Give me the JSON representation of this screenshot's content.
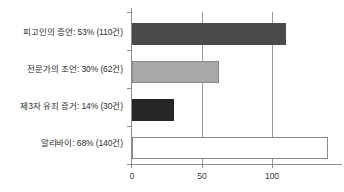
{
  "chart_data": {
    "type": "bar",
    "orientation": "horizontal",
    "title": "",
    "xlabel": "",
    "ylabel": "",
    "xlim": [
      0,
      150
    ],
    "xticks": [
      0,
      50,
      100
    ],
    "xtick_labels": [
      "0",
      "50",
      "100"
    ],
    "grid": true,
    "legend": false,
    "categories": [
      "피고인의 증언: 53% (110건)",
      "전문가의 조언: 30% (62건)",
      "제3자 유죄 증거: 14% (30건)",
      "알리바이: 68% (140건)"
    ],
    "values": [
      110,
      62,
      30,
      140
    ],
    "percents": [
      53,
      30,
      14,
      68
    ],
    "counts": [
      110,
      62,
      30,
      140
    ],
    "bar_colors": [
      "#4a4a4a",
      "#a9a9a9",
      "#262626",
      "#ffffff"
    ],
    "bar_edge_colors": [
      "#4a4a4a",
      "#8a8a8a",
      "#262626",
      "#8a8a8a"
    ]
  },
  "axis": {
    "tick_0": "0",
    "tick_50": "50",
    "tick_100": "100"
  }
}
